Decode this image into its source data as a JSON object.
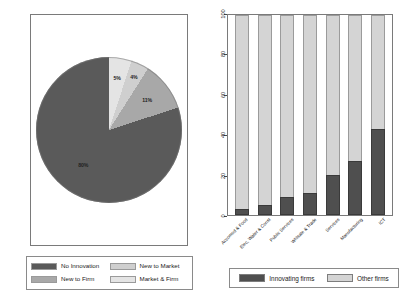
{
  "colors": {
    "no_innovation": "#5a5a5a",
    "new_to_firm": "#a8a8a8",
    "new_to_market": "#cfcfcf",
    "market_and_firm": "#e4e4e4",
    "innovating_firms": "#4f4f4f",
    "other_firms": "#d4d4d4",
    "frame": "#7a7a7a",
    "text": "#1a1a1a"
  },
  "pie_legend": {
    "items": [
      {
        "label": "No Innovation",
        "color": "#5a5a5a"
      },
      {
        "label": "New to Market",
        "color": "#cfcfcf"
      },
      {
        "label": "New to Firm",
        "color": "#a8a8a8"
      },
      {
        "label": "Market & Firm",
        "color": "#e4e4e4"
      }
    ]
  },
  "bar_legend": {
    "items": [
      {
        "label": "Innovating firms",
        "color": "#4f4f4f"
      },
      {
        "label": "Other firms",
        "color": "#d4d4d4"
      }
    ]
  },
  "chart_data": [
    {
      "type": "pie",
      "title": "",
      "labels": [
        "No Innovation",
        "New to Firm",
        "New to Market",
        "Market & Firm"
      ],
      "values": [
        80,
        11,
        4,
        5
      ],
      "data_labels": [
        "80%",
        "11%",
        "4%",
        "5%"
      ],
      "colors": [
        "#5a5a5a",
        "#a8a8a8",
        "#cfcfcf",
        "#e4e4e4"
      ],
      "units": "percent",
      "legend_position": "bottom",
      "start_angle_deg": 0,
      "direction": "counterclockwise"
    },
    {
      "type": "bar",
      "subtype": "stacked-percent",
      "title": "",
      "xlabel": "",
      "ylabel": "",
      "ylim": [
        0,
        100
      ],
      "yticks": [
        0,
        20,
        40,
        60,
        80,
        100
      ],
      "ytick_labels": [
        "0",
        "20",
        "40",
        "60",
        "80",
        "100"
      ],
      "grid": false,
      "legend_position": "bottom",
      "categories": [
        "Accomod & Food",
        "Elec, Water & Const",
        "Public Services",
        "Whlsale & Trade",
        "Services",
        "Manufacturing",
        "ICT"
      ],
      "series": [
        {
          "name": "Innovating firms",
          "color": "#4f4f4f",
          "values": [
            3,
            5,
            9,
            11,
            20,
            27,
            43
          ]
        },
        {
          "name": "Other firms",
          "color": "#d4d4d4",
          "values": [
            97,
            95,
            91,
            89,
            80,
            73,
            57
          ]
        }
      ]
    }
  ]
}
